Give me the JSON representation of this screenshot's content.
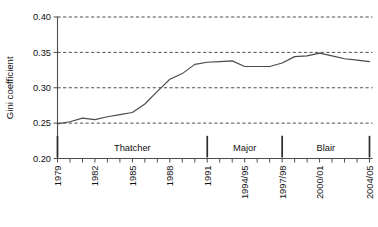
{
  "chart_data": {
    "type": "line",
    "title": "",
    "xlabel": "",
    "ylabel": "Gini coefficient",
    "ylim": [
      0.2,
      0.4
    ],
    "yticks": [
      0.2,
      0.25,
      0.3,
      0.35,
      0.4
    ],
    "ytick_labels": [
      "0.20",
      "0.25",
      "0.30",
      "0.35",
      "0.40"
    ],
    "grid": true,
    "grid_axis": "y",
    "grid_style": "dashed",
    "legend": "none",
    "x": [
      "1979",
      "1980",
      "1981",
      "1982",
      "1983",
      "1984",
      "1985",
      "1986",
      "1987",
      "1988",
      "1989",
      "1990",
      "1991",
      "1992",
      "1993",
      "1994/95",
      "1995/96",
      "1996/97",
      "1997/98",
      "1998/99",
      "1999/00",
      "2000/01",
      "2001/02",
      "2002/03",
      "2003/04",
      "2004/05"
    ],
    "xtick_labels": [
      "1979",
      "1982",
      "1985",
      "1988",
      "1991",
      "1994/95",
      "1997/98",
      "2000/01",
      "2004/05"
    ],
    "xtick_label_indices": [
      0,
      3,
      6,
      9,
      12,
      15,
      18,
      21,
      25
    ],
    "xtick_label_rotation": -90,
    "values": [
      0.249,
      0.252,
      0.257,
      0.255,
      0.259,
      0.262,
      0.265,
      0.277,
      0.295,
      0.312,
      0.32,
      0.333,
      0.336,
      0.337,
      0.338,
      0.33,
      0.33,
      0.33,
      0.335,
      0.344,
      0.345,
      0.349,
      0.345,
      0.341,
      0.339,
      0.337
    ],
    "series_name": "Gini coefficient",
    "annotations": [
      {
        "label": "Thatcher",
        "start_index": 0,
        "end_index": 12,
        "marker_at_index": 0
      },
      {
        "label": "Major",
        "start_index": 12,
        "end_index": 18,
        "marker_at_index": 12
      },
      {
        "label": "Blair",
        "start_index": 18,
        "end_index": 25,
        "marker_at_index": 18
      }
    ],
    "era_end_marker_index": 25,
    "annotation_band_value": 0.215
  },
  "colors": {
    "line": "#4a4a4a",
    "axis": "#4d4d4d",
    "grid": "#3a3a3a",
    "era_marker": "#2b2b2b",
    "background": "#ffffff",
    "text": "#111111"
  }
}
